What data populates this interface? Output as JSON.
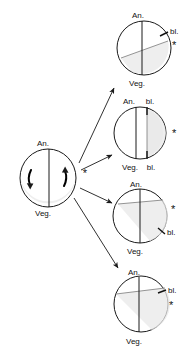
{
  "figure": {
    "title": "",
    "background_color": "#ffffff",
    "ink_color": "#1a1a1a",
    "shade_color": "#e8e8e8",
    "width": 191,
    "height": 351
  },
  "labels": {
    "animal_pole": "An.",
    "vegetal_pole": "Veg.",
    "blastopore": "bl.",
    "asterisk": "*"
  },
  "source_cell": {
    "name": "uncleaved-egg",
    "animal_label": "An.",
    "vegetal_label": "Veg.",
    "asterisk": "*",
    "rotation_arrows": [
      {
        "name": "left-rotation-arrow",
        "direction": "down"
      },
      {
        "name": "right-rotation-arrow",
        "direction": "up"
      }
    ]
  },
  "outcomes": [
    {
      "id": "outcome-1",
      "animal_label": "An.",
      "vegetal_label": "Veg.",
      "blastopore_labels": [
        "bl."
      ],
      "asterisk": "*",
      "blastopore_position": "upper-right",
      "asterisk_position": "right"
    },
    {
      "id": "outcome-2",
      "animal_label": "An.",
      "vegetal_label": "Veg.",
      "blastopore_labels": [
        "bl.",
        "bl."
      ],
      "asterisk": "*",
      "blastopore_position": "top-and-bottom",
      "asterisk_position": "right"
    },
    {
      "id": "outcome-3",
      "animal_label": "An.",
      "vegetal_label": "Veg.",
      "blastopore_labels": [
        "bl."
      ],
      "asterisk": "*",
      "blastopore_position": "lower-right",
      "asterisk_position": "upper-right"
    },
    {
      "id": "outcome-4",
      "animal_label": "An.",
      "vegetal_label": "Veg.",
      "blastopore_labels": [
        "bl."
      ],
      "asterisk": "*",
      "blastopore_position": "upper-right",
      "asterisk_position": "right"
    }
  ],
  "arrows": [
    {
      "name": "arrow-to-outcome-1"
    },
    {
      "name": "arrow-to-outcome-2"
    },
    {
      "name": "arrow-to-outcome-3"
    },
    {
      "name": "arrow-to-outcome-4"
    }
  ]
}
